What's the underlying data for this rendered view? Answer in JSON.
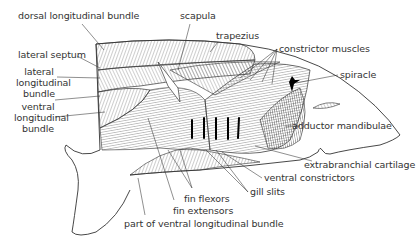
{
  "diagram": {
    "labels": {
      "dorsal_longitudinal_bundle": "dorsal longitudinal bundle",
      "scapula": "scapula",
      "trapezius": "trapezius",
      "constrictor_muscles": "constrictor muscles",
      "spiracle": "spiracle",
      "lateral_septum": "lateral septum",
      "lateral_longitudinal_bundle_1": "lateral",
      "lateral_longitudinal_bundle_2": "longitudinal",
      "lateral_longitudinal_bundle_3": "bundle",
      "ventral_longitudinal_bundle_1": "ventral",
      "ventral_longitudinal_bundle_2": "longitudinal",
      "ventral_longitudinal_bundle_3": "bundle",
      "adductor_mandibulae": "adductor mandibulae",
      "extrabranchial_cartilage": "extrabranchial cartilage",
      "ventral_constrictors": "ventral constrictors",
      "gill_slits": "gill slits",
      "fin_flexors": "fin flexors",
      "fin_extensors": "fin extensors",
      "part_of_ventral_longitudinal_bundle": "part of ventral longitudinal bundle"
    },
    "colors": {
      "ink": "#333333",
      "muscle_fill": "#d8d8d8",
      "muscle_dark": "#b5b5b5",
      "background": "#ffffff"
    }
  }
}
